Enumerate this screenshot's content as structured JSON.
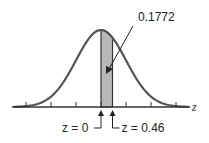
{
  "chart_data": {
    "type": "area",
    "title": "",
    "xlabel": "z",
    "xlim": [
      -3.5,
      3.5
    ],
    "tick_values": [
      -3,
      -2,
      -1,
      0,
      1,
      2,
      3
    ],
    "shaded_region": {
      "from": 0,
      "to": 0.46,
      "area": 0.1772
    },
    "annotations": {
      "area_label": "0.1772",
      "left_marker": "z = 0",
      "right_marker": "z = 0.46",
      "axis_label": "z"
    }
  },
  "colors": {
    "curve": "#555555",
    "shade": "#b8b8b8",
    "axis": "#333333"
  }
}
